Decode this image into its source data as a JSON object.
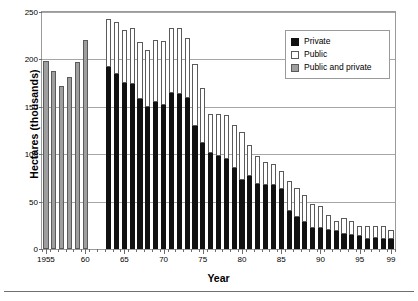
{
  "chart_data": {
    "type": "bar",
    "stacked": true,
    "title": "",
    "xlabel": "Year",
    "ylabel": "Hectares (thousands)",
    "ylim": [
      0,
      250
    ],
    "ytick_values": [
      0,
      50,
      100,
      150,
      200,
      250
    ],
    "ytick_labels": [
      "0",
      "50",
      "100",
      "150",
      "200",
      "250"
    ],
    "grid": true,
    "legend_position": "upper right",
    "x": [
      1955,
      1956,
      1957,
      1958,
      1959,
      1960,
      1961,
      1962,
      1963,
      1964,
      1965,
      1966,
      1967,
      1968,
      1969,
      1970,
      1971,
      1972,
      1973,
      1974,
      1975,
      1976,
      1977,
      1978,
      1979,
      1980,
      1981,
      1982,
      1983,
      1984,
      1985,
      1986,
      1987,
      1988,
      1989,
      1990,
      1991,
      1992,
      1993,
      1994,
      1995,
      1996,
      1997,
      1998,
      1999
    ],
    "xtick_labels": [
      "1955",
      "60",
      "65",
      "70",
      "75",
      "80",
      "85",
      "90",
      "95",
      "99"
    ],
    "xtick_years": [
      1955,
      1960,
      1965,
      1970,
      1975,
      1980,
      1985,
      1990,
      1995,
      1999
    ],
    "series": [
      {
        "name": "Private",
        "color": "#111111",
        "values": [
          null,
          null,
          null,
          null,
          null,
          null,
          null,
          null,
          192,
          185,
          175,
          174,
          158,
          150,
          155,
          152,
          165,
          163,
          159,
          130,
          112,
          101,
          98,
          95,
          85,
          73,
          77,
          69,
          68,
          68,
          63,
          40,
          34,
          29,
          22,
          22,
          20,
          19,
          16,
          15,
          14,
          11,
          12,
          11,
          11
        ]
      },
      {
        "name": "Public",
        "color": "#ffffff",
        "values": [
          null,
          null,
          null,
          null,
          null,
          null,
          null,
          null,
          51,
          55,
          56,
          59,
          60,
          60,
          66,
          67,
          68,
          70,
          64,
          65,
          58,
          41,
          44,
          46,
          46,
          50,
          33,
          29,
          24,
          22,
          19,
          32,
          30,
          28,
          26,
          23,
          16,
          11,
          17,
          15,
          10,
          13,
          12,
          13,
          9
        ]
      },
      {
        "name": "Public and private",
        "color": "#9e9e9e",
        "values": [
          198,
          188,
          172,
          181,
          197,
          221,
          null,
          null,
          null,
          null,
          null,
          null,
          null,
          null,
          null,
          null,
          null,
          null,
          null,
          null,
          null,
          null,
          null,
          null,
          null,
          null,
          null,
          null,
          null,
          null,
          null,
          null,
          null,
          null,
          null,
          null,
          null,
          null,
          null,
          null,
          null,
          null,
          null,
          null,
          null
        ]
      }
    ],
    "totals": [
      198,
      188,
      172,
      181,
      197,
      221,
      243,
      240,
      243,
      240,
      231,
      233,
      218,
      210,
      221,
      219,
      233,
      233,
      223,
      195,
      170,
      142,
      142,
      141,
      131,
      123,
      110,
      98,
      92,
      90,
      82,
      72,
      64,
      57,
      48,
      45,
      36,
      30,
      33,
      30,
      24,
      24,
      24,
      24,
      20
    ]
  },
  "legend": {
    "items": [
      {
        "label": "Private"
      },
      {
        "label": "Public"
      },
      {
        "label": "Public and private"
      }
    ]
  },
  "caption": {
    "sliver_text": ""
  }
}
